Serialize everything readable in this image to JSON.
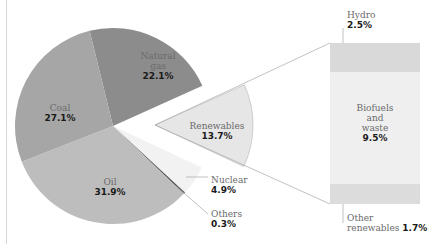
{
  "chart_data": {
    "type": "pie",
    "title": "",
    "slices": [
      {
        "label": "Natural gas",
        "value": 22.1,
        "display": "22.1%",
        "color": "#8c8c8c"
      },
      {
        "label": "Renewables",
        "value": 13.7,
        "display": "13.7%",
        "color": "#e6e6e6",
        "exploded": true
      },
      {
        "label": "Nuclear",
        "value": 4.9,
        "display": "4.9%",
        "color": "#f2f2f2"
      },
      {
        "label": "Others",
        "value": 0.3,
        "display": "0.3%",
        "color": "#555555"
      },
      {
        "label": "Oil",
        "value": 31.9,
        "display": "31.9%",
        "color": "#bdbdbd"
      },
      {
        "label": "Coal",
        "value": 27.1,
        "display": "27.1%",
        "color": "#a6a6a6"
      }
    ],
    "breakdown": {
      "of": "Renewables",
      "type": "stacked-bar",
      "segments": [
        {
          "label": "Hydro",
          "value": 2.5,
          "display": "2.5%",
          "color": "#d9d9d9"
        },
        {
          "label": "Biofuels and waste",
          "value": 9.5,
          "display": "9.5%",
          "color": "#efefef"
        },
        {
          "label": "Other renewables",
          "value": 1.7,
          "display": "1.7%",
          "color": "#dcdcdc"
        }
      ]
    }
  },
  "labels": {
    "gas": {
      "name_line1": "Natural",
      "name_line2": "gas",
      "value": "22.1%"
    },
    "coal": {
      "name": "Coal",
      "value": "27.1%"
    },
    "oil": {
      "name": "Oil",
      "value": "31.9%"
    },
    "renewables": {
      "name": "Renewables",
      "value": "13.7%"
    },
    "nuclear": {
      "name": "Nuclear",
      "value": "4.9%"
    },
    "others": {
      "name": "Others",
      "value": "0.3%"
    },
    "hydro": {
      "name": "Hydro",
      "value": "2.5%"
    },
    "biofuels": {
      "line1": "Biofuels",
      "line2": "and",
      "line3": "waste",
      "value": "9.5%"
    },
    "other_renewables": {
      "line1": "Other",
      "line2": "renewables",
      "value": "1.7%"
    }
  }
}
